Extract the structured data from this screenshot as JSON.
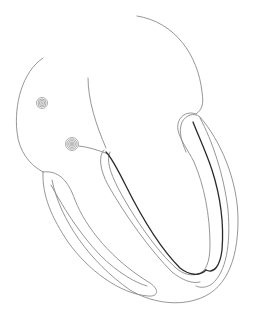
{
  "diagram": {
    "width": 253,
    "height": 312,
    "colors": {
      "background": "#ffffff",
      "outline": "#8a8a8a",
      "conduction_path": "#2a2a2a"
    },
    "elements": [
      {
        "id": "sa-node",
        "shape": "spiral",
        "cx": 42,
        "cy": 103,
        "r": 6
      },
      {
        "id": "av-node",
        "shape": "spiral",
        "cx": 72,
        "cy": 144,
        "r": 7
      },
      {
        "id": "left-bundle-branch",
        "shape": "path"
      },
      {
        "id": "right-bundle-branch",
        "shape": "path"
      }
    ]
  }
}
